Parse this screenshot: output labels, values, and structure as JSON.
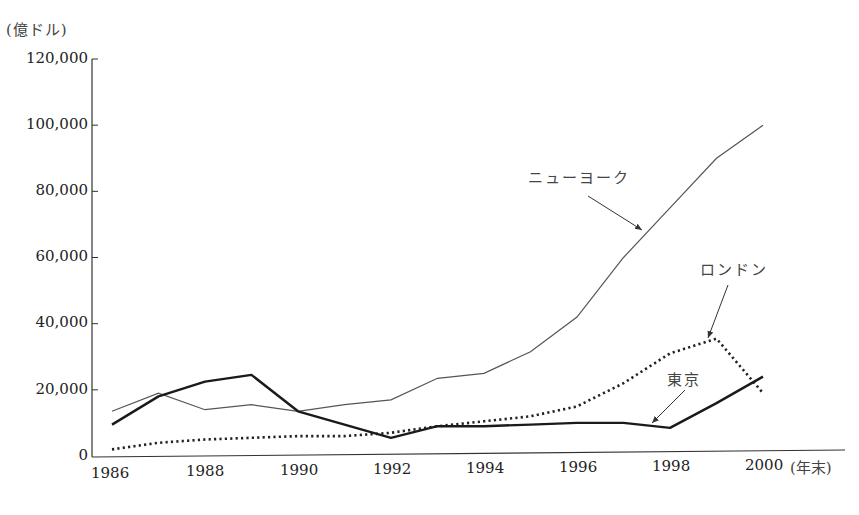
{
  "chart_data": {
    "type": "line",
    "title": "",
    "unit_label": "(億ドル)",
    "xlabel": "(年末)",
    "ylabel": "(億ドル)",
    "ylim": [
      0,
      120000
    ],
    "xlim": [
      1986,
      2000
    ],
    "grid": false,
    "legend_position": "inline annotations with arrows",
    "yticks": [
      0,
      20000,
      40000,
      60000,
      80000,
      100000,
      120000
    ],
    "ytick_labels": [
      "0",
      "20,000",
      "40,000",
      "60,000",
      "80,000",
      "100,000",
      "120,000"
    ],
    "xticks": [
      1986,
      1988,
      1990,
      1992,
      1994,
      1996,
      1998,
      2000
    ],
    "xtick_labels": [
      "1986",
      "1988",
      "1990",
      "1992",
      "1994",
      "1996",
      "1998",
      "2000"
    ],
    "x": [
      1986,
      1987,
      1988,
      1989,
      1990,
      1991,
      1992,
      1993,
      1994,
      1995,
      1996,
      1997,
      1998,
      1999,
      2000
    ],
    "series": [
      {
        "name": "ニューヨーク",
        "style": "thin-solid",
        "values": [
          13500,
          19000,
          14000,
          15500,
          13500,
          15500,
          17000,
          23500,
          25000,
          31500,
          42000,
          60000,
          75000,
          90000,
          100000
        ]
      },
      {
        "name": "ロンドン",
        "style": "dotted",
        "values": [
          2000,
          4000,
          5000,
          5500,
          6000,
          6000,
          7000,
          9000,
          10500,
          12000,
          15000,
          22000,
          31000,
          35500,
          19000
        ]
      },
      {
        "name": "東京",
        "style": "thick-solid",
        "values": [
          9500,
          18000,
          22500,
          24500,
          13500,
          9500,
          5500,
          9000,
          9000,
          9500,
          10000,
          10000,
          8500,
          16000,
          24000
        ]
      }
    ],
    "annotations": [
      {
        "text": "ニューヨーク",
        "target_series": "ニューヨーク"
      },
      {
        "text": "ロンドン",
        "target_series": "ロンドン"
      },
      {
        "text": "東京",
        "target_series": "東京"
      }
    ]
  }
}
